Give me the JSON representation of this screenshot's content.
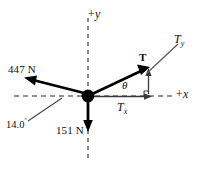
{
  "diagram": {
    "origin": {
      "x": 88,
      "y": 96,
      "radius": 6,
      "color": "#000000"
    },
    "axes": {
      "x_label": "+x",
      "y_label": "+y",
      "style": "dashed",
      "color": "#6b6b6b",
      "x_start": 14,
      "x_end": 172,
      "y_start": 18,
      "y_end": 162
    },
    "vectors": [
      {
        "name": "force-447",
        "label": "447 N",
        "direction": "up-left",
        "angle_from_negative_x_deg": 14.0,
        "tip": {
          "x": 26,
          "y": 79
        },
        "color": "#000000"
      },
      {
        "name": "force-151",
        "label": "151 N",
        "direction": "down",
        "tip": {
          "x": 88,
          "y": 131
        },
        "color": "#000000"
      },
      {
        "name": "tension-T",
        "label": "T",
        "direction": "up-right",
        "tip": {
          "x": 148,
          "y": 68
        },
        "color": "#000000"
      }
    ],
    "components": [
      {
        "name": "Tx",
        "label": "T",
        "subscript": "x",
        "axis": "horizontal"
      },
      {
        "name": "Ty",
        "label": "T",
        "subscript": "y",
        "axis": "vertical"
      }
    ],
    "angles": [
      {
        "name": "theta",
        "symbol": "θ",
        "between": "T and +x axis"
      },
      {
        "name": "angle-14",
        "value": "14.0",
        "degree_symbol": "º",
        "between": "447 N and -x axis"
      }
    ]
  }
}
